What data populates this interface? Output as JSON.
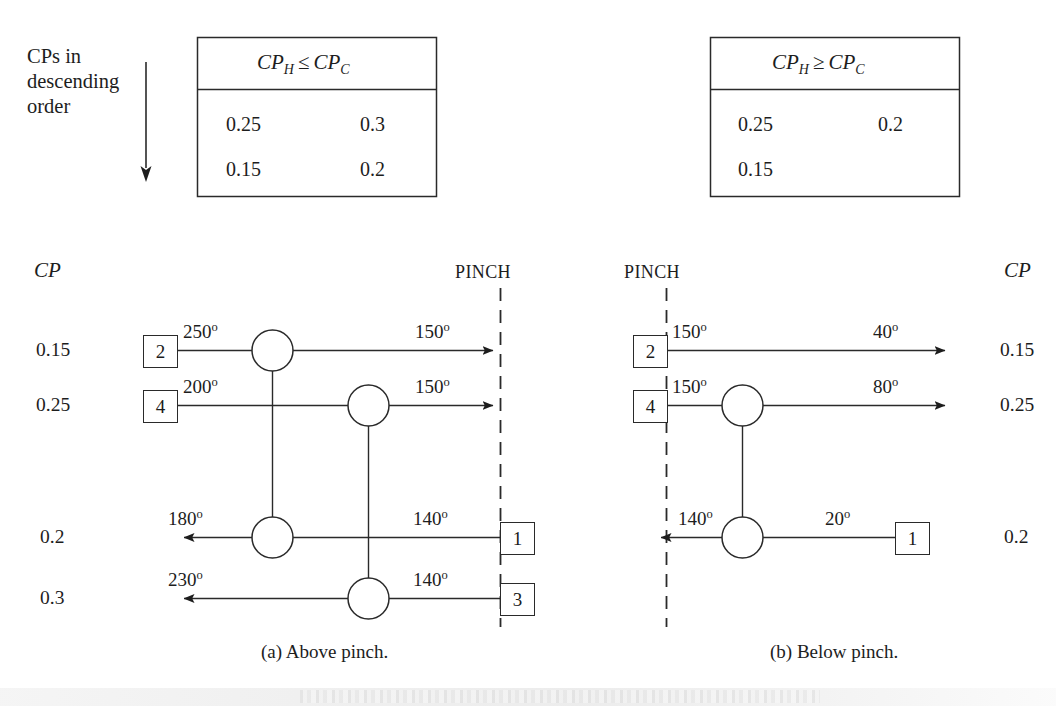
{
  "figure": {
    "side_note": [
      "CPs in",
      "descending",
      "order"
    ],
    "captions": {
      "a": "(a) Above pinch.",
      "b": "(b) Below pinch."
    },
    "pinch_label": "PINCH",
    "cp_axis_label": "CP",
    "degree_symbol": "o"
  },
  "tables": [
    {
      "id": "table-above-pinch",
      "header": "CP_H ≤ CP_C",
      "header_parts": {
        "lhs_base": "CP",
        "lhs_sub": "H",
        "relation": "≤",
        "rhs_base": "CP",
        "rhs_sub": "C"
      },
      "rows": [
        [
          "0.25",
          "0.3"
        ],
        [
          "0.15",
          "0.2"
        ]
      ]
    },
    {
      "id": "table-below-pinch",
      "header": "CP_H ≥ CP_C",
      "header_parts": {
        "lhs_base": "CP",
        "lhs_sub": "H",
        "relation": "≥",
        "rhs_base": "CP",
        "rhs_sub": "C"
      },
      "rows": [
        [
          "0.25",
          "0.2"
        ],
        [
          "0.15",
          ""
        ]
      ]
    }
  ],
  "diagrams": [
    {
      "id": "above-pinch",
      "caption": "(a) Above pinch.",
      "pinch_label": "PINCH",
      "cp_header": "CP",
      "cp_values": [
        "0.15",
        "0.25",
        "0.2",
        "0.3"
      ],
      "streams": [
        {
          "cp": "0.15",
          "direction": "right",
          "start_box": "2",
          "start_temp": "250",
          "end_temp": "150",
          "end_marker": "arrow-to-pinch"
        },
        {
          "cp": "0.25",
          "direction": "right",
          "start_box": "4",
          "start_temp": "200",
          "end_temp": "150",
          "end_marker": "arrow-to-pinch"
        },
        {
          "cp": "0.2",
          "direction": "left",
          "start_box": "1",
          "start_temp": "140",
          "end_temp": "180",
          "end_marker": "arrow-left"
        },
        {
          "cp": "0.3",
          "direction": "left",
          "start_box": "3",
          "start_temp": "140",
          "end_temp": "230",
          "end_marker": "arrow-left"
        }
      ],
      "exchangers": [
        {
          "name": "exchanger-2-1",
          "hot_stream_cp": "0.15",
          "cold_stream_cp": "0.2"
        },
        {
          "name": "exchanger-4-3",
          "hot_stream_cp": "0.25",
          "cold_stream_cp": "0.3"
        }
      ]
    },
    {
      "id": "below-pinch",
      "caption": "(b) Below pinch.",
      "pinch_label": "PINCH",
      "cp_header": "CP",
      "cp_values": [
        "0.15",
        "0.25",
        "0.2"
      ],
      "streams": [
        {
          "cp": "0.15",
          "direction": "right",
          "start_box": "2",
          "start_temp": "150",
          "end_temp": "40",
          "end_marker": "arrow-right"
        },
        {
          "cp": "0.25",
          "direction": "right",
          "start_box": "4",
          "start_temp": "150",
          "end_temp": "80",
          "end_marker": "arrow-right"
        },
        {
          "cp": "0.2",
          "direction": "left",
          "start_box": "1",
          "start_temp": "20",
          "end_temp": "140",
          "end_marker": "arrow-to-pinch-left"
        }
      ],
      "exchangers": [
        {
          "name": "exchanger-4-1",
          "hot_stream_cp": "0.25",
          "cold_stream_cp": "0.2"
        }
      ]
    }
  ],
  "colors": {
    "ink": "#1d1d1d",
    "line": "#2a2a2a",
    "background": "#ffffff"
  }
}
